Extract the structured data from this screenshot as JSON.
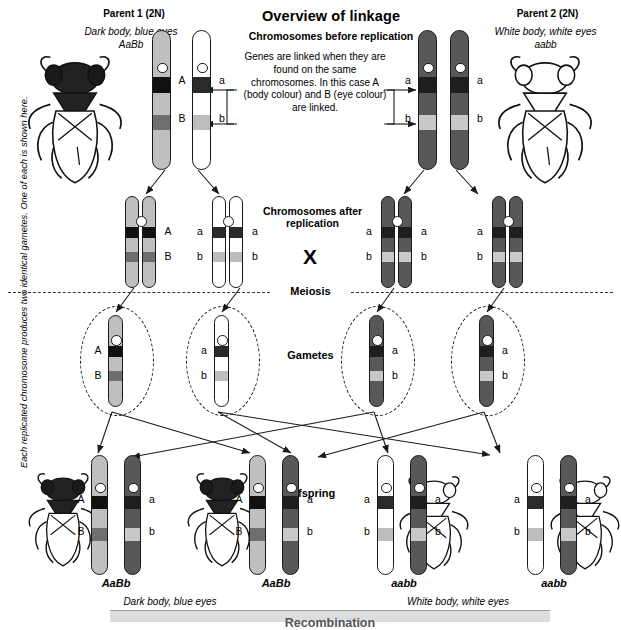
{
  "title": "Overview of linkage",
  "sections": {
    "before_replication_heading": "Chromosomes before replication",
    "linkage_note": "Genes are linked when they are found on the same chromosomes. In this case A (body colour) and B (eye colour) are linked.",
    "after_replication_heading": "Chromosomes after replication",
    "cross_symbol": "X",
    "meiosis_label": "Meiosis",
    "gametes_label": "Gametes",
    "offspring_label": "Offspring",
    "side_note": "Each replicated chromosome produces two identical gametes. One of each is shown here.",
    "banner_heading": "Recombination"
  },
  "parents": [
    {
      "title": "Parent 1 (2N)",
      "phenotype": "Dark body, blue eyes",
      "genotype": "AaBb",
      "fly": "dark-fly",
      "chromosomes": [
        {
          "alleles": [
            "A",
            "B"
          ],
          "label_side": "right",
          "body": "#bfbfbf",
          "band_a": "#111111",
          "band_b": "#6e6e6e"
        },
        {
          "alleles": [
            "a",
            "b"
          ],
          "label_side": "right",
          "body": "#ffffff",
          "band_a": "#2a2a2a",
          "band_b": "#bdbdbd"
        }
      ]
    },
    {
      "title": "Parent 2 (2N)",
      "phenotype": "White body, white eyes",
      "genotype": "aabb",
      "fly": "white-fly",
      "chromosomes": [
        {
          "alleles": [
            "a",
            "b"
          ],
          "label_side": "left",
          "body": "#585858",
          "band_a": "#1e1e1e",
          "band_b": "#c8c8c8"
        },
        {
          "alleles": [
            "a",
            "b"
          ],
          "label_side": "right",
          "body": "#585858",
          "band_a": "#1e1e1e",
          "band_b": "#c8c8c8"
        }
      ]
    }
  ],
  "replicated": [
    {
      "alleles": [
        "A",
        "B"
      ],
      "body": "#bfbfbf",
      "band_a": "#111111",
      "band_b": "#6e6e6e",
      "label_side": "right"
    },
    {
      "alleles": [
        "a",
        "b"
      ],
      "body": "#ffffff",
      "band_a": "#2a2a2a",
      "band_b": "#bdbdbd",
      "label_side": "both"
    },
    {
      "alleles": [
        "a",
        "b"
      ],
      "body": "#585858",
      "band_a": "#1e1e1e",
      "band_b": "#c8c8c8",
      "label_side": "both"
    },
    {
      "alleles": [
        "a",
        "b"
      ],
      "body": "#585858",
      "band_a": "#1e1e1e",
      "band_b": "#c8c8c8",
      "label_side": "left"
    }
  ],
  "gametes": [
    {
      "alleles": [
        "A",
        "B"
      ],
      "body": "#bfbfbf",
      "band_a": "#111111",
      "band_b": "#6e6e6e",
      "label_side": "left"
    },
    {
      "alleles": [
        "a",
        "b"
      ],
      "body": "#ffffff",
      "band_a": "#2a2a2a",
      "band_b": "#bdbdbd",
      "label_side": "left"
    },
    {
      "alleles": [
        "a",
        "b"
      ],
      "body": "#585858",
      "band_a": "#1e1e1e",
      "band_b": "#c8c8c8",
      "label_side": "right"
    },
    {
      "alleles": [
        "a",
        "b"
      ],
      "body": "#585858",
      "band_a": "#1e1e1e",
      "band_b": "#c8c8c8",
      "label_side": "right"
    }
  ],
  "offspring": [
    {
      "genotype": "AaBb",
      "fly": "dark-fly",
      "fly_side": "left",
      "chromosomes": [
        {
          "alleles": [
            "A",
            "B"
          ],
          "label_side": "left",
          "body": "#bfbfbf",
          "band_a": "#111111",
          "band_b": "#6e6e6e"
        },
        {
          "alleles": [
            "a",
            "b"
          ],
          "label_side": "right",
          "body": "#585858",
          "band_a": "#1e1e1e",
          "band_b": "#c8c8c8"
        }
      ]
    },
    {
      "genotype": "AaBb",
      "fly": "dark-fly",
      "fly_side": "left",
      "chromosomes": [
        {
          "alleles": [
            "A",
            "B"
          ],
          "label_side": "left",
          "body": "#bfbfbf",
          "band_a": "#111111",
          "band_b": "#6e6e6e"
        },
        {
          "alleles": [
            "a",
            "b"
          ],
          "label_side": "right",
          "body": "#585858",
          "band_a": "#1e1e1e",
          "band_b": "#c8c8c8"
        }
      ]
    },
    {
      "genotype": "aabb",
      "fly": "white-fly",
      "fly_side": "right",
      "chromosomes": [
        {
          "alleles": [
            "a",
            "b"
          ],
          "label_side": "left",
          "body": "#ffffff",
          "band_a": "#2a2a2a",
          "band_b": "#bdbdbd"
        },
        {
          "alleles": [
            "a",
            "b"
          ],
          "label_side": "right",
          "body": "#585858",
          "band_a": "#1e1e1e",
          "band_b": "#c8c8c8"
        }
      ]
    },
    {
      "genotype": "aabb",
      "fly": "white-fly",
      "fly_side": "right",
      "chromosomes": [
        {
          "alleles": [
            "a",
            "b"
          ],
          "label_side": "left",
          "body": "#ffffff",
          "band_a": "#2a2a2a",
          "band_b": "#bdbdbd"
        },
        {
          "alleles": [
            "a",
            "b"
          ],
          "label_side": "right",
          "body": "#585858",
          "band_a": "#1e1e1e",
          "band_b": "#c8c8c8"
        }
      ]
    }
  ],
  "offspring_captions": {
    "left": "Dark body, blue eyes",
    "right": "White body, white eyes"
  },
  "colors": {
    "outline": "#1a1a1a",
    "banner_bg": "#dcdcdc",
    "dashed": "#111111"
  }
}
